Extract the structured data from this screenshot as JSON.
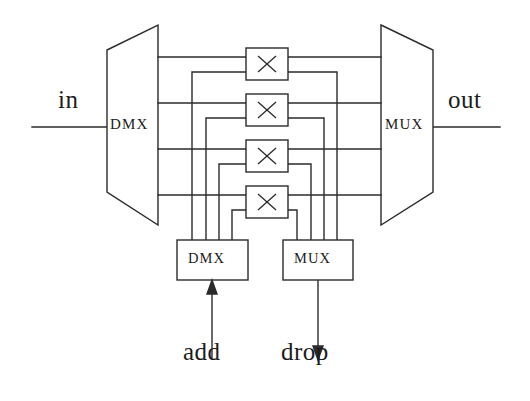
{
  "figure": {
    "kind": "schematic-diagram",
    "background_color": "#ffffff",
    "line_color": "#2b2b2b",
    "text_color": "#1c1c1c",
    "width": 530,
    "height": 401
  },
  "labels": {
    "input": "in",
    "output": "out",
    "add": "add",
    "drop": "drop",
    "main_demux": "DMX",
    "main_mux": "MUX",
    "add_demux": "DMX",
    "drop_mux": "MUX"
  },
  "blocks": {
    "main_demux": {
      "name": "DMX",
      "shape": "trapezoid",
      "orientation": "narrow-left",
      "x_left": 107,
      "x_right": 158,
      "y_top_left": 50,
      "y_bottom_left": 192,
      "y_top_right": 25,
      "y_bottom_right": 225
    },
    "main_mux": {
      "name": "MUX",
      "shape": "trapezoid",
      "orientation": "narrow-right",
      "x_left": 381,
      "x_right": 433,
      "y_top_left": 25,
      "y_bottom_left": 225,
      "y_top_right": 50,
      "y_bottom_right": 192
    },
    "add_demux": {
      "name": "DMX",
      "shape": "rectangle",
      "x": 177,
      "y": 240,
      "width": 71,
      "height": 40
    },
    "drop_mux": {
      "name": "MUX",
      "shape": "rectangle",
      "x": 283,
      "y": 240,
      "width": 70,
      "height": 40
    }
  },
  "switch_elements": {
    "glyph": "×",
    "count": 4,
    "boxes": [
      {
        "index": 1,
        "x": 246,
        "y": 48,
        "width": 42,
        "height": 32
      },
      {
        "index": 2,
        "x": 246,
        "y": 94,
        "width": 42,
        "height": 32
      },
      {
        "index": 3,
        "x": 246,
        "y": 140,
        "width": 42,
        "height": 32
      },
      {
        "index": 4,
        "x": 246,
        "y": 186,
        "width": 42,
        "height": 32
      }
    ]
  },
  "channels": {
    "count": 4,
    "bus_y": [
      57,
      103,
      149,
      195
    ],
    "tap_y": [
      72,
      118,
      164,
      210
    ],
    "add_drop_x": [
      192,
      206,
      219,
      232
    ],
    "drop_bus_x": [
      297,
      311,
      324,
      337
    ]
  },
  "io_lines": {
    "in_y": 127,
    "in_x_start": 32,
    "in_x_end": 107,
    "out_y": 127,
    "out_x_start": 433,
    "out_x_end": 500,
    "add_arrow": {
      "x": 212,
      "y_tail": 360,
      "y_head": 280,
      "direction": "up"
    },
    "drop_arrow": {
      "x": 318,
      "y_tail": 280,
      "y_head": 360,
      "direction": "down"
    }
  },
  "label_positions": {
    "in": {
      "x": 56,
      "y": 100
    },
    "out": {
      "x": 450,
      "y": 100
    },
    "add": {
      "x": 185,
      "y": 355
    },
    "drop": {
      "x": 283,
      "y": 355
    }
  }
}
